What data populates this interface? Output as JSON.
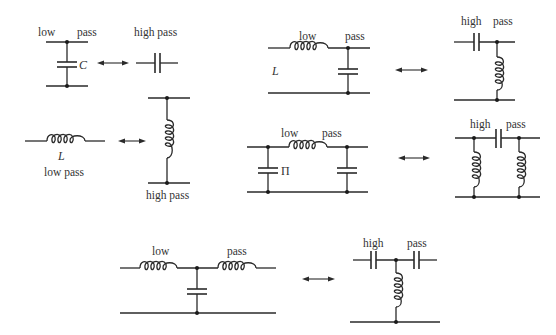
{
  "colors": {
    "line": "#2a2a2a",
    "text": "#333333",
    "background": "#ffffff"
  },
  "circuits": {
    "shunt_cap_low": {
      "label_left": "low",
      "label_right": "pass",
      "component": "C",
      "kind": "low pass"
    },
    "series_cap_high": {
      "label": "high pass",
      "kind": "high pass"
    },
    "series_ind_low": {
      "component": "L",
      "label": "low pass",
      "kind": "low pass"
    },
    "shunt_ind_high": {
      "label": "high pass",
      "kind": "high pass"
    },
    "l_low": {
      "label_left": "low",
      "label_right": "pass",
      "component": "L",
      "kind": "low pass"
    },
    "l_high": {
      "label_left": "high",
      "label_right": "pass",
      "kind": "high pass"
    },
    "pi_low": {
      "label_left": "low",
      "label_right": "pass",
      "component": "Π",
      "kind": "low pass"
    },
    "pi_high": {
      "label_left": "high",
      "label_right": "pass",
      "kind": "high pass"
    },
    "t_low": {
      "label_left": "low",
      "label_right": "pass",
      "kind": "low pass"
    },
    "t_high": {
      "label_left": "high",
      "label_right": "pass",
      "kind": "high pass"
    }
  },
  "arrows": [
    {
      "from": "shunt_cap_low",
      "to": "series_cap_high",
      "icon": "double-arrow-icon"
    },
    {
      "from": "series_ind_low",
      "to": "shunt_ind_high",
      "icon": "double-arrow-icon"
    },
    {
      "from": "l_low",
      "to": "l_high",
      "icon": "double-arrow-icon"
    },
    {
      "from": "pi_low",
      "to": "pi_high",
      "icon": "double-arrow-icon"
    },
    {
      "from": "t_low",
      "to": "t_high",
      "icon": "double-arrow-icon"
    }
  ]
}
